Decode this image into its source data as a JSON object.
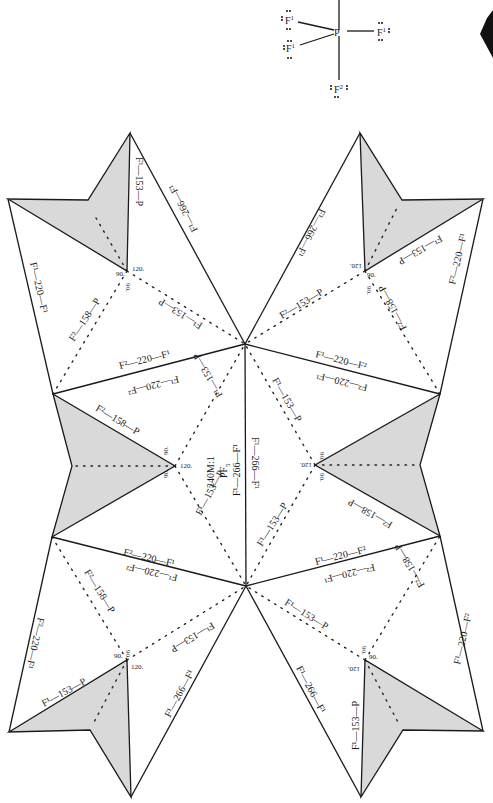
{
  "model_label": {
    "id": "240M:1",
    "formula": "PF",
    "formula_sub": "5"
  },
  "lewis_structure": {
    "center": "P",
    "atoms": [
      {
        "symbol": "F",
        "sup": "1",
        "position": "upper-left"
      },
      {
        "symbol": "F",
        "sup": "1",
        "position": "lower-left"
      },
      {
        "symbol": "F",
        "sup": "1",
        "position": "right"
      },
      {
        "symbol": "F",
        "sup": "2",
        "position": "bottom"
      }
    ]
  },
  "colors": {
    "tab_fill": "#d9d9d9",
    "line": "#1a1a1a",
    "background": "#ffffff"
  },
  "edge_labels": {
    "f1_266_f1": "F¹—266—F¹",
    "f1_153_p": "F¹—153—P",
    "f2_158_p": "F²—158—P",
    "f1_220_f2": "F¹—220—F²",
    "f2_220_f1": "F²—220—F¹",
    "f1_220_f1": "F¹—220—F¹",
    "f2_153_p": "F²—153—P"
  },
  "angles": {
    "a90": "90.",
    "a120": "120."
  }
}
